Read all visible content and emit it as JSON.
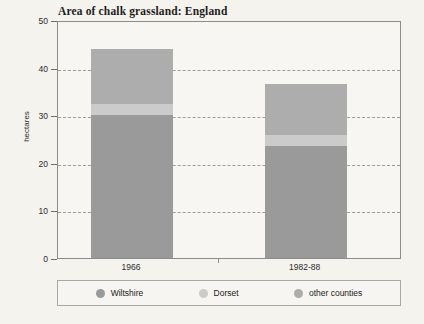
{
  "chart_data": {
    "type": "bar",
    "subtype": "stacked-bar",
    "title": "Area of chalk grassland: England",
    "xlabel": "",
    "ylabel": "hectares",
    "categories": [
      "1966",
      "1982-88"
    ],
    "ylim": [
      0,
      50
    ],
    "yticks": [
      0,
      10,
      20,
      30,
      40,
      50
    ],
    "grid": "horizontal-dashed",
    "legend_position": "bottom",
    "series": [
      {
        "name": "Wiltshire",
        "values": [
          30,
          23.5
        ],
        "color": "#9a9a9a"
      },
      {
        "name": "Dorset",
        "values": [
          2.3,
          2.4
        ],
        "color": "#cbcbcb"
      },
      {
        "name": "other counties",
        "values": [
          11.7,
          10.6
        ],
        "color": "#adadad"
      }
    ],
    "totals": [
      44,
      36.5
    ]
  },
  "axis": {
    "y_tick_labels": [
      "50",
      "40",
      "30",
      "20",
      "10",
      "0"
    ],
    "y_title": "hectares",
    "x_tick_labels": [
      "1966",
      "1982-88"
    ]
  },
  "legend": {
    "items": [
      {
        "label": "Wiltshire",
        "color": "#9a9a9a"
      },
      {
        "label": "Dorset",
        "color": "#cbcbcb"
      },
      {
        "label": "other counties",
        "color": "#adadad"
      }
    ]
  },
  "colors": {
    "background": "#f4f3ee",
    "plot_background": "#f7f6f2",
    "frame": "#8c8c8c",
    "gridline": "#9b9b9b",
    "text": "#2b2b2b"
  }
}
